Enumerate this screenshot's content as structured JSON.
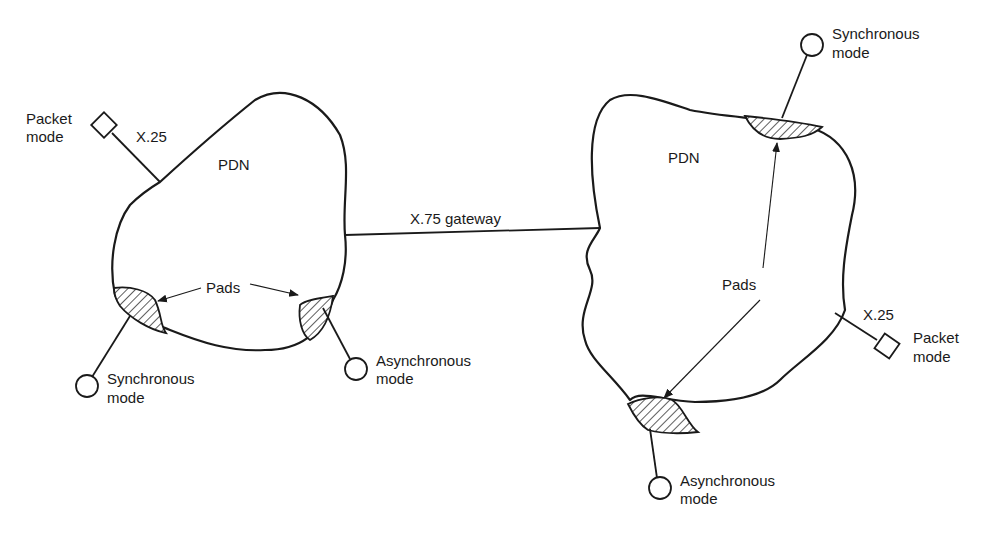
{
  "diagram": {
    "colors": {
      "ink": "#1a1a1a",
      "background": "#ffffff"
    },
    "left_network": {
      "label": "PDN",
      "packet_terminal": {
        "label_line1": "Packet",
        "label_line2": "mode",
        "shape": "diamond",
        "link_label": "X.25"
      },
      "sync_terminal": {
        "label_line1": "Synchronous",
        "label_line2": "mode",
        "shape": "circle"
      },
      "async_terminal": {
        "label_line1": "Asynchronous",
        "label_line2": "mode",
        "shape": "circle"
      },
      "pads_label": "Pads"
    },
    "gateway": {
      "label": "X.75 gateway"
    },
    "right_network": {
      "label": "PDN",
      "sync_terminal": {
        "label_line1": "Synchronous",
        "label_line2": "mode",
        "shape": "circle"
      },
      "packet_terminal": {
        "label_line1": "Packet",
        "label_line2": "mode",
        "shape": "diamond",
        "link_label": "X.25"
      },
      "async_terminal": {
        "label_line1": "Asynchronous",
        "label_line2": "mode",
        "shape": "circle"
      },
      "pads_label": "Pads"
    }
  }
}
